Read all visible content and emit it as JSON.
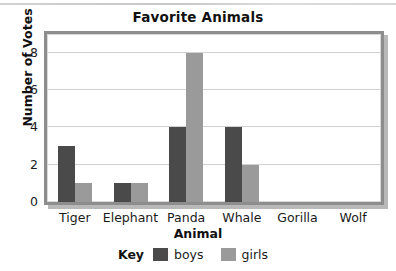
{
  "chart_data": {
    "type": "bar",
    "title": "Favorite Animals",
    "xlabel": "Animal",
    "ylabel": "Number of Votes",
    "categories": [
      "Tiger",
      "Elephant",
      "Panda",
      "Whale",
      "Gorilla",
      "Wolf"
    ],
    "series": [
      {
        "name": "boys",
        "color": "#4a4a4a",
        "values": [
          3,
          1,
          4,
          4,
          0,
          0
        ]
      },
      {
        "name": "girls",
        "color": "#9a9a9a",
        "values": [
          1,
          1,
          8,
          2,
          0,
          0
        ]
      }
    ],
    "ylim": [
      0,
      9
    ],
    "yticks": [
      0,
      2,
      4,
      6,
      8
    ],
    "ytick_labels": [
      "0",
      "2",
      "4",
      "6",
      "8"
    ],
    "grid": "horizontal",
    "legend_position": "bottom",
    "legend_title": "Key"
  },
  "legend": {
    "key_label": "Key",
    "entries": [
      {
        "label": "boys"
      },
      {
        "label": "girls"
      }
    ]
  }
}
